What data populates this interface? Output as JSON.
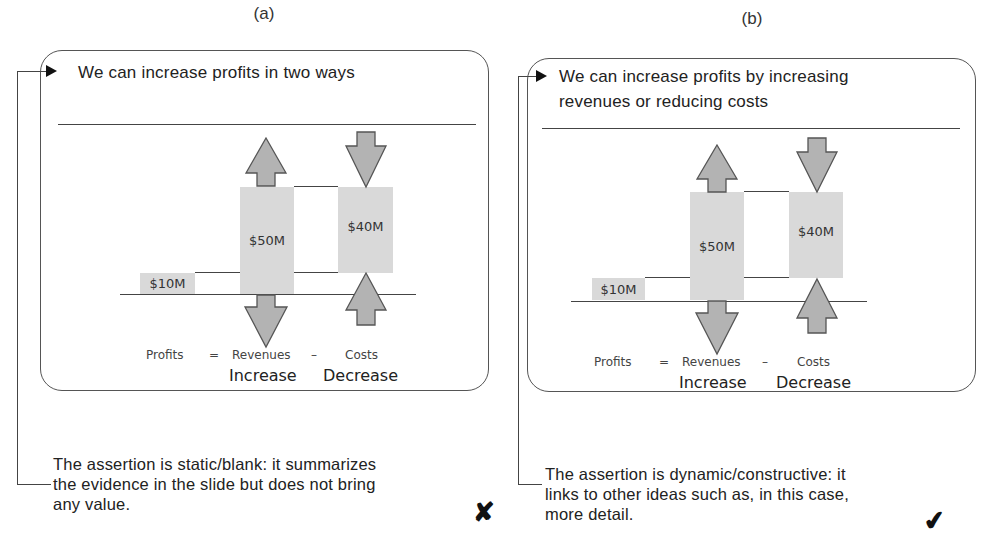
{
  "figure": {
    "panels": [
      {
        "label": "(a)",
        "slide_title_lines": [
          "We can increase profits in two ways"
        ],
        "diagram": {
          "profits_value": "$10M",
          "revenues_value": "$50M",
          "costs_value": "$40M",
          "equation": {
            "profits": "Profits",
            "equals": "=",
            "revenues": "Revenues",
            "minus": "–",
            "costs": "Costs"
          },
          "revenues_direction": "Increase",
          "costs_direction": "Decrease"
        },
        "caption_lines": [
          "The assertion is static/blank: it summarizes",
          "the evidence in the slide but does not bring",
          "any value."
        ],
        "verdict_icon": "cross-mark-icon",
        "verdict_glyph": "✘"
      },
      {
        "label": "(b)",
        "slide_title_lines": [
          "We can increase profits by increasing",
          "revenues or reducing costs"
        ],
        "diagram": {
          "profits_value": "$10M",
          "revenues_value": "$50M",
          "costs_value": "$40M",
          "equation": {
            "profits": "Profits",
            "equals": "=",
            "revenues": "Revenues",
            "minus": "–",
            "costs": "Costs"
          },
          "revenues_direction": "Increase",
          "costs_direction": "Decrease"
        },
        "caption_lines": [
          "The assertion is dynamic/constructive: it",
          "links to other ideas such as, in this case,",
          "more detail."
        ],
        "verdict_icon": "check-mark-icon",
        "verdict_glyph": "✔"
      }
    ]
  },
  "colors": {
    "bar_fill": "#d9d9d9",
    "arrow_fill": "#b3b3b3",
    "arrow_stroke": "#555555",
    "line": "#444444"
  }
}
